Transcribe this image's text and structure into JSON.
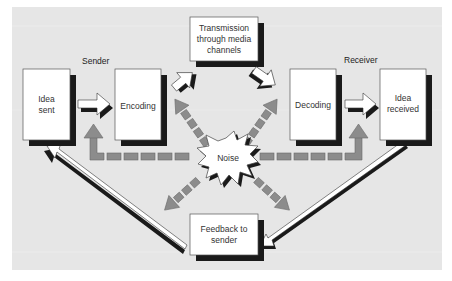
{
  "diagram": {
    "colors": {
      "panel": "#e6e6e6",
      "box_fill": "#ffffff",
      "shadow": "#1a1a1a",
      "noise_arrow": "#8c8c8c",
      "text": "#333333"
    },
    "labels": {
      "sender": "Sender",
      "receiver": "Receiver"
    },
    "nodes": {
      "idea_sent": {
        "line1": "Idea",
        "line2": "sent"
      },
      "encoding": {
        "line1": "Encoding"
      },
      "transmission": {
        "line1": "Transmission",
        "line2": "through media",
        "line3": "channels"
      },
      "decoding": {
        "line1": "Decoding"
      },
      "idea_received": {
        "line1": "Idea",
        "line2": "received"
      },
      "noise": {
        "line1": "Noise"
      },
      "feedback": {
        "line1": "Feedback to",
        "line2": "sender"
      }
    },
    "edges": [
      {
        "from": "Idea sent",
        "to": "Encoding"
      },
      {
        "from": "Encoding",
        "to": "Transmission through media channels"
      },
      {
        "from": "Transmission through media channels",
        "to": "Decoding"
      },
      {
        "from": "Decoding",
        "to": "Idea received"
      },
      {
        "from": "Idea received",
        "to": "Feedback to sender"
      },
      {
        "from": "Feedback to sender",
        "to": "Idea sent"
      },
      {
        "from": "Noise",
        "to": "Encoding",
        "style": "dashed"
      },
      {
        "from": "Noise",
        "to": "Transmission through media channels",
        "style": "dashed"
      },
      {
        "from": "Noise",
        "to": "Decoding",
        "style": "dashed"
      },
      {
        "from": "Noise",
        "to": "Idea received",
        "style": "dashed"
      },
      {
        "from": "Noise",
        "to": "Feedback to sender",
        "style": "dashed"
      },
      {
        "from": "Noise",
        "to": "Idea sent",
        "style": "dashed"
      }
    ]
  }
}
